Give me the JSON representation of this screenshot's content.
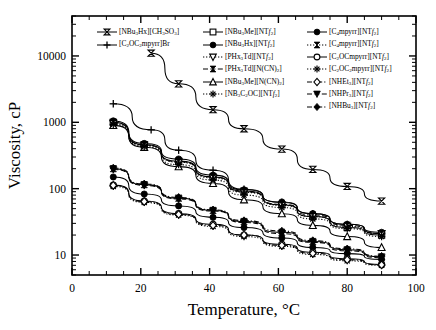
{
  "chart_data": {
    "type": "line",
    "title": "",
    "xlabel": "Temperature, °C",
    "ylabel": "Viscosity, cP",
    "xlim": [
      0,
      100
    ],
    "ylim": [
      5,
      40000
    ],
    "yscale": "log",
    "xticks": [
      0,
      20,
      40,
      60,
      80,
      100
    ],
    "xtick_labels": [
      "0",
      "20",
      "40",
      "60",
      "80",
      "100"
    ],
    "yticks": [
      10,
      100,
      1000,
      10000
    ],
    "ytick_labels": [
      "10",
      "100",
      "1000",
      "10000"
    ],
    "grid": false,
    "legend_position": "top-center",
    "series": [
      {
        "name": "[NBu3Hx][CH3SO3]",
        "marker": "bowtie",
        "line": "solid",
        "x": [
          23,
          31,
          41,
          50,
          61,
          70,
          80,
          90
        ],
        "y": [
          11000,
          3800,
          1550,
          800,
          395,
          195,
          108,
          65
        ]
      },
      {
        "name": "[C2OC2mpyrr]Br",
        "marker": "plus",
        "line": "solid",
        "x": [
          12,
          23,
          31,
          41,
          50,
          61,
          70,
          80,
          90
        ],
        "y": [
          1900,
          770,
          380,
          190,
          98,
          62,
          42,
          29,
          21
        ]
      },
      {
        "name": "[NBu3Me][NTf2]",
        "marker": "open-square",
        "line": "solid",
        "x": [
          12,
          21,
          31,
          41,
          50,
          61,
          70,
          80,
          90
        ],
        "y": [
          1000,
          460,
          260,
          150,
          92,
          57,
          38,
          26,
          20
        ]
      },
      {
        "name": "[NBu3Hx][NTf2]",
        "marker": "filled-circle",
        "line": "solid",
        "x": [
          12,
          21,
          31,
          41,
          50,
          61,
          70,
          80,
          90
        ],
        "y": [
          1050,
          480,
          280,
          160,
          96,
          63,
          42,
          29,
          22
        ]
      },
      {
        "name": "[PHx3Td][NTf2]",
        "marker": "open-triangle-down",
        "line": "dotted",
        "x": [
          12,
          21,
          31,
          41,
          50,
          61,
          70,
          80,
          90
        ],
        "y": [
          960,
          450,
          250,
          145,
          88,
          56,
          38,
          27,
          21
        ]
      },
      {
        "name": "[PHx3Td][N(CN)2]",
        "marker": "bowtie-filled",
        "line": "dashed",
        "x": [
          12,
          21,
          31,
          41,
          50,
          61,
          70,
          80,
          90
        ],
        "y": [
          990,
          455,
          255,
          150,
          90,
          58,
          40,
          28,
          21
        ]
      },
      {
        "name": "[NBu3Me][N(CN)2]",
        "marker": "open-triangle-up",
        "line": "solid",
        "x": [
          12,
          21,
          31,
          41,
          50,
          61,
          70,
          80,
          90
        ],
        "y": [
          900,
          420,
          215,
          120,
          68,
          42,
          28,
          19,
          13
        ]
      },
      {
        "name": "[NB3C2OC][NTf2]",
        "marker": "star",
        "line": "dotted",
        "x": [
          12,
          21,
          31,
          41,
          50,
          61,
          70,
          80,
          90
        ],
        "y": [
          930,
          430,
          230,
          135,
          80,
          52,
          35,
          25,
          19
        ]
      },
      {
        "name": "[C4mpyrr][NTf2]",
        "marker": "filled-circle",
        "line": "solid",
        "x": [
          12,
          21,
          31,
          41,
          50,
          61,
          70,
          80,
          90
        ],
        "y": [
          150,
          83,
          55,
          37,
          26,
          18,
          13,
          10.5,
          8.6
        ]
      },
      {
        "name": "[C4mpyrr][NTf2]",
        "marker": "bowtie-filled",
        "line": "solid",
        "x": [
          12,
          21,
          31,
          41,
          50,
          61,
          70,
          80,
          90
        ],
        "y": [
          200,
          115,
          72,
          47,
          32,
          22,
          16,
          12,
          9.4
        ]
      },
      {
        "name": "[C2OCmpyrr][NTf2]",
        "marker": "open-circle",
        "line": "solid",
        "x": [
          12,
          21,
          31,
          41,
          50,
          61,
          70,
          80,
          90
        ],
        "y": [
          113,
          65,
          42,
          29,
          20,
          14.5,
          11,
          8.8,
          7.2
        ]
      },
      {
        "name": "[C2OC2mpyrr][NTf2]",
        "marker": "star",
        "line": "dotted",
        "x": [
          12,
          21,
          31,
          41,
          50,
          61,
          70,
          80,
          90
        ],
        "y": [
          108,
          62,
          40,
          27,
          19,
          13.5,
          10.2,
          8.2,
          7.0
        ]
      },
      {
        "name": "[NHEt3][NTf2]",
        "marker": "open-diamond",
        "line": "dash-dot",
        "x": [
          12,
          21,
          31,
          41,
          50,
          61,
          70,
          80,
          90
        ],
        "y": [
          112,
          64,
          41,
          28,
          20,
          14,
          10.6,
          8.5,
          7.1
        ]
      },
      {
        "name": "[NHPr3][NTf2]",
        "marker": "filled-triangle-down",
        "line": "dashed",
        "x": [
          12,
          21,
          31,
          41,
          50,
          61,
          70,
          80,
          90
        ],
        "y": [
          195,
          112,
          70,
          46,
          31,
          21,
          15.5,
          11.6,
          9.1
        ]
      },
      {
        "name": "[NHBu3][NTf2]",
        "marker": "filled-diamond",
        "line": "dash-dot",
        "x": [
          12,
          21,
          31,
          41,
          50,
          61,
          70,
          80,
          90
        ],
        "y": [
          205,
          118,
          74,
          48,
          33,
          23,
          16.5,
          12.4,
          9.6
        ]
      }
    ]
  },
  "axes": {
    "x_title": "Temperature, °C",
    "y_title": "Viscosity, cP",
    "x_labels": [
      "0",
      "20",
      "40",
      "60",
      "80",
      "100"
    ],
    "y_labels": [
      "10",
      "100",
      "1000",
      "10000"
    ]
  },
  "legend": {
    "columns": [
      {
        "entries": [
          {
            "label_html": "[NBu<sub>3</sub>Hx][CH<sub>3</sub>SO<sub>3</sub>]",
            "marker": "bowtie",
            "line": "solid"
          },
          {
            "label_html": "[C<sub>2</sub>OC<sub>2</sub>mpyrr]Br",
            "marker": "plus",
            "line": "solid"
          }
        ]
      },
      {
        "entries": [
          {
            "label_html": "[NBu<sub>3</sub>Me][NT<i>f</i><sub>2</sub>]",
            "marker": "open-square",
            "line": "solid"
          },
          {
            "label_html": "[NBu<sub>3</sub>Hx][NT<i>f</i><sub>2</sub>]",
            "marker": "filled-circle",
            "line": "solid"
          },
          {
            "label_html": "[PHx<sub>3</sub>Td][NT<i>f</i><sub>2</sub>]",
            "marker": "open-triangle-down",
            "line": "dotted"
          },
          {
            "label_html": "[PHx<sub>3</sub>Td][N(CN)<sub>2</sub>]",
            "marker": "bowtie-filled",
            "line": "dashed"
          },
          {
            "label_html": "[NBu<sub>3</sub>Me][N(CN)<sub>2</sub>]",
            "marker": "open-triangle-up",
            "line": "solid"
          },
          {
            "label_html": "[NB<sub>3</sub>C<sub>2</sub>OC][NT<i>f</i><sub>2</sub>]",
            "marker": "star",
            "line": "dotted"
          }
        ]
      },
      {
        "entries": [
          {
            "label_html": "[C<sub>4</sub>mpyrr][NT<i>f</i><sub>2</sub>]",
            "marker": "filled-circle",
            "line": "solid"
          },
          {
            "label_html": "[C<sub>4</sub>mpyrr][NT<i>f</i><sub>2</sub>]",
            "marker": "bowtie-filled",
            "line": "dotted"
          },
          {
            "label_html": "[C<sub>2</sub>OCmpyrr][NT<i>f</i><sub>2</sub>]",
            "marker": "open-circle",
            "line": "solid"
          },
          {
            "label_html": "[C<sub>2</sub>OC<sub>2</sub>mpyrr][NT<i>f</i><sub>2</sub>]",
            "marker": "star",
            "line": "dotted"
          },
          {
            "label_html": "[NHEt<sub>3</sub>][NT<i>f</i><sub>2</sub>]",
            "marker": "open-diamond",
            "line": "dash-dot"
          },
          {
            "label_html": "[NHPr<sub>3</sub>][NT<i>f</i><sub>2</sub>]",
            "marker": "filled-triangle-down",
            "line": "dashed"
          },
          {
            "label_html": "[NHBu<sub>3</sub>][NT<i>f</i><sub>2</sub>]",
            "marker": "filled-diamond",
            "line": "dash-dot"
          }
        ]
      }
    ]
  },
  "style": {
    "ink": "#000000",
    "background": "#ffffff"
  }
}
